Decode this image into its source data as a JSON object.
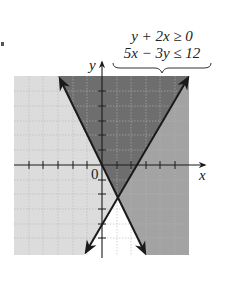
{
  "figure": {
    "inequalities": [
      "y + 2x ≥ 0",
      "5x − 3y ≤ 12"
    ],
    "axis_labels": {
      "x": "x",
      "y": "y",
      "origin": "0"
    },
    "colors": {
      "both_regions": "#6e6e6e",
      "only_first": "#a3a3a3",
      "only_second": "#dcdcdc",
      "neither": "#ffffff",
      "grid": "#bdbdbd",
      "lines": "#1a1a1a"
    },
    "plot": {
      "xrange": [
        -6,
        6
      ],
      "yrange": [
        -6,
        6
      ],
      "tick_spacing": 1,
      "boundary_lines": [
        {
          "equation": "y = -2x",
          "from_inequality": "y + 2x ≥ 0",
          "style": "solid"
        },
        {
          "equation": "y = (5x - 12)/3",
          "from_inequality": "5x − 3y ≤ 12",
          "style": "solid"
        }
      ],
      "intersection": {
        "x": 1.09,
        "y": -2.18
      }
    }
  }
}
